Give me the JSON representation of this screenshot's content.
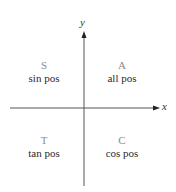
{
  "axes": {
    "x_label": "x",
    "y_label": "y"
  },
  "quadrants": [
    {
      "position": "II",
      "letter": "S",
      "description": "sin pos"
    },
    {
      "position": "I",
      "letter": "A",
      "description": "all pos"
    },
    {
      "position": "III",
      "letter": "T",
      "description": "tan pos"
    },
    {
      "position": "IV",
      "letter": "C",
      "description": "cos pos"
    }
  ],
  "colors": {
    "axis": "#555555",
    "letter": "#8a8a8a",
    "text": "#2a2a2a"
  }
}
